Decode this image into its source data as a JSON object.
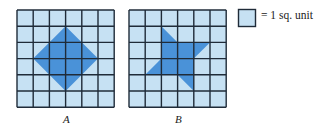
{
  "figure": {
    "grid_size": 6,
    "colors": {
      "cell_fill": "#c6e1f3",
      "shape_fill": "#4a92d8",
      "grid_line": "#1f2b38"
    },
    "grids": [
      {
        "label": "A",
        "origin": [
          17,
          10
        ],
        "cell": 16.2,
        "shape": "rotated square (diamond)",
        "vertices": [
          [
            3,
            1
          ],
          [
            5,
            3
          ],
          [
            3,
            5
          ],
          [
            1,
            3
          ]
        ]
      },
      {
        "label": "B",
        "origin": [
          129,
          10
        ],
        "cell": 16.2,
        "shape": "pinwheel",
        "central_square": [
          [
            2,
            2
          ],
          [
            4,
            2
          ],
          [
            4,
            4
          ],
          [
            2,
            4
          ]
        ],
        "triangles": [
          [
            [
              2,
              1
            ],
            [
              3,
              2
            ],
            [
              2,
              2
            ]
          ],
          [
            [
              4,
              2
            ],
            [
              5,
              2
            ],
            [
              4,
              3
            ]
          ],
          [
            [
              3,
              4
            ],
            [
              4,
              4
            ],
            [
              4,
              5
            ]
          ],
          [
            [
              2,
              3
            ],
            [
              2,
              4
            ],
            [
              1,
              4
            ]
          ]
        ]
      }
    ],
    "legend": {
      "text": "= 1 sq. unit"
    }
  }
}
